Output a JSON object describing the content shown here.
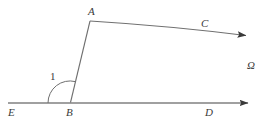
{
  "figure": {
    "background_color": "#ffffff",
    "stroke_color": "#777777",
    "text_color": "#3a3a3a",
    "width": 277,
    "height": 127
  },
  "labels": {
    "point_a": "A",
    "point_b": "B",
    "point_c": "C",
    "point_d": "D",
    "point_e": "E",
    "angle_one": "1",
    "region_omega": "Ω"
  },
  "geometry": {
    "baseline": {
      "name": "ray-ED",
      "start": [
        8,
        103
      ],
      "end": [
        250,
        103
      ],
      "arrow": "end"
    },
    "segment_ba": {
      "name": "segment-BA",
      "start": [
        70,
        103
      ],
      "end": [
        90,
        21
      ]
    },
    "curve_ac": {
      "name": "curve-AC",
      "start": [
        90,
        21
      ],
      "control": [
        168,
        25
      ],
      "end": [
        248,
        36
      ],
      "arrow": "end"
    },
    "angle_arc": {
      "name": "angle-arc-1",
      "center": [
        70,
        103
      ],
      "radius": 22,
      "start_angle_deg": 180,
      "end_angle_deg": 76
    },
    "points": {
      "A": [
        90,
        21
      ],
      "B": [
        70,
        103
      ],
      "C": [
        204,
        24
      ],
      "D": [
        208,
        113
      ],
      "E": [
        11,
        113
      ]
    }
  }
}
